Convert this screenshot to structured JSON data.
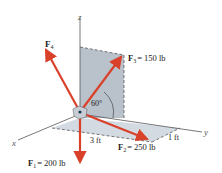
{
  "diagram": {
    "axes": {
      "x": "x",
      "y": "y",
      "z": "z"
    },
    "forces": [
      {
        "id": "F1",
        "symbol": "F",
        "subscript": "1",
        "value": "= 200 lb"
      },
      {
        "id": "F2",
        "symbol": "F",
        "subscript": "2",
        "value": "= 250 lb"
      },
      {
        "id": "F3",
        "symbol": "F",
        "subscript": "3",
        "value": "= 150 lb"
      },
      {
        "id": "F4",
        "symbol": "F",
        "subscript": "4",
        "value": ""
      }
    ],
    "dimensions": {
      "angle": "60°",
      "length_x": "3 ft",
      "length_y": "1 ft"
    },
    "colors": {
      "force_arrow": "#d9412b",
      "plane_vertical": "#b9c1cb",
      "plane_horizontal": "#d3dae2",
      "axis": "#555555"
    }
  }
}
